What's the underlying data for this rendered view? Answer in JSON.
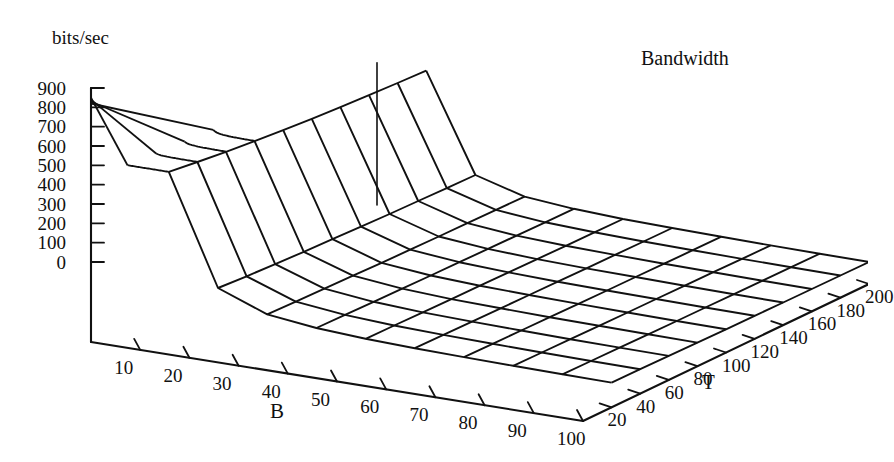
{
  "figure": {
    "title": "Bandwidth",
    "z_axis_caption": "bits/sec",
    "x_axis_name": "B",
    "y_axis_name": "T"
  },
  "chart_data": {
    "type": "surface3d",
    "title": "Bandwidth",
    "xlabel": "B",
    "ylabel": "T",
    "zlabel": "bits/sec",
    "grid": true,
    "legend": "none",
    "projection": "isometric-wireframe",
    "xlim": [
      0,
      100
    ],
    "ylim": [
      0,
      200
    ],
    "zlim": [
      0,
      900
    ],
    "x_ticks": [
      10,
      20,
      30,
      40,
      50,
      60,
      70,
      80,
      90,
      100
    ],
    "y_ticks": [
      20,
      40,
      60,
      80,
      100,
      120,
      140,
      160,
      180,
      200
    ],
    "z_ticks": [
      900,
      800,
      700,
      600,
      500,
      400,
      300,
      200,
      100,
      0
    ],
    "x": [
      10,
      20,
      30,
      40,
      50,
      60,
      70,
      80,
      90,
      100
    ],
    "y": [
      20,
      40,
      60,
      80,
      100,
      120,
      140,
      160,
      180,
      200
    ],
    "z_note": "rows indexed by T (y) from 20 to 200; columns indexed by B (x) from 10 to 100",
    "z": [
      [
        850,
        290,
        195,
        165,
        150,
        142,
        137,
        133,
        130,
        128
      ],
      [
        830,
        280,
        190,
        162,
        148,
        140,
        135,
        131,
        128,
        126
      ],
      [
        812,
        272,
        186,
        159,
        145,
        138,
        133,
        129,
        126,
        124
      ],
      [
        796,
        265,
        182,
        156,
        143,
        136,
        131,
        127,
        124,
        122
      ],
      [
        782,
        259,
        178,
        153,
        141,
        134,
        129,
        125,
        122,
        120
      ],
      [
        770,
        253,
        175,
        151,
        139,
        132,
        127,
        124,
        121,
        119
      ],
      [
        760,
        248,
        172,
        149,
        137,
        130,
        126,
        122,
        119,
        117
      ],
      [
        751,
        244,
        170,
        147,
        135,
        129,
        124,
        121,
        118,
        116
      ],
      [
        743,
        240,
        168,
        145,
        134,
        127,
        123,
        119,
        117,
        115
      ],
      [
        736,
        237,
        166,
        144,
        132,
        126,
        122,
        118,
        116,
        114
      ]
    ]
  }
}
